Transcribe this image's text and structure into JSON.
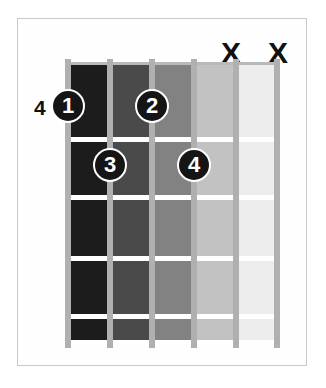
{
  "diagram": {
    "type": "guitar-chord-diagram",
    "title": "",
    "position_label": "4",
    "strings_count": 6,
    "frets_count": 5,
    "start_fret": 4,
    "background_color": "#ffffff",
    "border_color": "#c9c9c9",
    "string_color": "#b0b0b0",
    "fret_line_color": "#ffffff",
    "dot_fill_color": "#151515",
    "dot_ring_color": "#ffffff",
    "text_color": "#111111"
  },
  "fretboard": {
    "cells": [
      {
        "shade": "#1c1c1c"
      },
      {
        "shade": "#4a4a4a"
      },
      {
        "shade": "#828282"
      },
      {
        "shade": "#c2c2c2"
      },
      {
        "shade": "#ededed"
      }
    ],
    "strings": [
      {
        "index": 1,
        "x": 0
      },
      {
        "index": 2,
        "x": 42
      },
      {
        "index": 3,
        "x": 84
      },
      {
        "index": 4,
        "x": 126
      },
      {
        "index": 5,
        "x": 168
      },
      {
        "index": 6,
        "x": 209
      }
    ],
    "fret_lines_y": [
      75,
      133,
      194,
      252,
      278
    ]
  },
  "fingerings": [
    {
      "label": "1",
      "string": 1,
      "fret": 4,
      "x": 58,
      "y": 89
    },
    {
      "label": "2",
      "string": 3,
      "fret": 4,
      "x": 133,
      "y": 89
    },
    {
      "label": "3",
      "string": 2,
      "fret": 5,
      "x": 92,
      "y": 148
    },
    {
      "label": "4",
      "string": 4,
      "fret": 5,
      "x": 176,
      "y": 148
    }
  ],
  "mutes": [
    {
      "label": "X",
      "string": 5,
      "x": 221,
      "y": 38
    },
    {
      "label": "X",
      "string": 6,
      "x": 268,
      "y": 38
    }
  ]
}
